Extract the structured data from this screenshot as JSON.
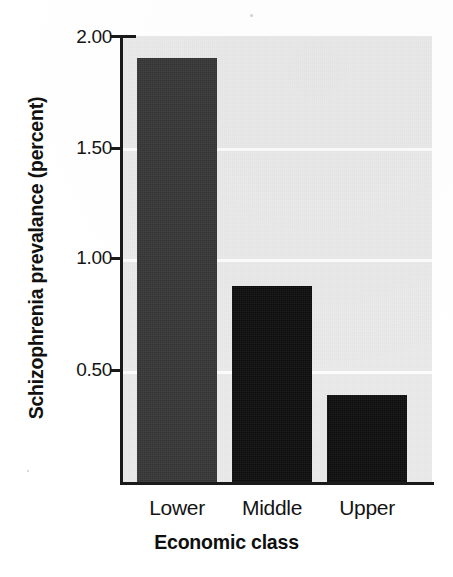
{
  "chart_data": {
    "type": "bar",
    "title": "",
    "categories": [
      "Lower",
      "Middle",
      "Upper"
    ],
    "values": [
      1.9,
      0.88,
      0.39
    ],
    "xlabel": "Economic class",
    "ylabel": "Schizophrenia prevalance (percent)",
    "ylim": [
      0,
      2.0
    ],
    "yticks": [
      "0.50",
      "1.00",
      "1.50",
      "2.00"
    ],
    "ytick_values": [
      0.5,
      1.0,
      1.5,
      2.0
    ],
    "grid": true,
    "legend": "none",
    "bar_colors": [
      "#363636",
      "#0d0d0d",
      "#0d0d0d"
    ],
    "plot_background": "#ebebeb",
    "gridline_color": "#fbfbfb",
    "axis_color": "#1a1a1a"
  },
  "axis": {
    "y_title": "Schizophrenia prevalance (percent)",
    "x_title": "Economic class",
    "y_tick_labels": [
      "2.00",
      "1.50",
      "1.00",
      "0.50"
    ],
    "x_tick_labels": [
      "Lower",
      "Middle",
      "Upper"
    ]
  },
  "bars": [
    {
      "label": "Lower",
      "value": "1.90"
    },
    {
      "label": "Middle",
      "value": "0.88"
    },
    {
      "label": "Upper",
      "value": "0.39"
    }
  ]
}
